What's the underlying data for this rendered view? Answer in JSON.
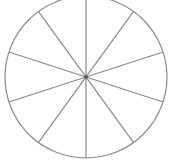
{
  "diagram": {
    "type": "divided-circle",
    "sectors": 10,
    "center": [
      86,
      77
    ],
    "radius": 81,
    "spoke_angles_deg": [
      90,
      54,
      18,
      -18,
      -54
    ],
    "stroke_color": "#8a8a8a",
    "center_dot_color": "#555555",
    "background": "#ffffff"
  }
}
